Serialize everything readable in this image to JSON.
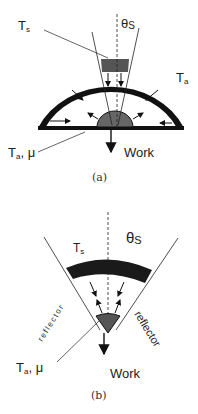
{
  "figure_a": {
    "label_sun_temp": "T",
    "label_sun_temp_sub": "s",
    "label_angle": "θ",
    "label_angle_sub": "S",
    "label_ambient_temp": "T",
    "label_ambient_temp_sub": "a",
    "label_absorber": "T",
    "label_absorber_sub": "a",
    "label_absorber_mu": ", μ",
    "label_work": "Work",
    "caption": "(a)"
  },
  "figure_b": {
    "label_sun_temp": "T",
    "label_sun_temp_sub": "s",
    "label_angle": "θ",
    "label_angle_sub": "S",
    "label_reflector_left": "reflector",
    "label_reflector_right": "reflector",
    "label_absorber": "T",
    "label_absorber_sub": "a",
    "label_absorber_mu": ", μ",
    "label_work": "Work",
    "caption": "(b)"
  },
  "colors": {
    "shell": "#111111",
    "sun_window": "#555555",
    "absorber": "#666666",
    "line": "#222222"
  }
}
